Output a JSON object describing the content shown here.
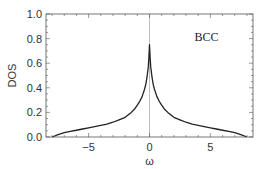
{
  "chart_data": {
    "type": "line",
    "title": "",
    "xlabel": "ω",
    "ylabel": "DOS",
    "xlim": [
      -8.5,
      8.5
    ],
    "ylim": [
      0.0,
      1.0
    ],
    "xticks": [
      -5,
      0,
      5
    ],
    "xtick_labels": [
      "−5",
      "0",
      "5"
    ],
    "yticks": [
      0.0,
      0.2,
      0.4,
      0.6,
      0.8,
      1.0
    ],
    "ytick_labels": [
      "0.0",
      "0.2",
      "0.4",
      "0.6",
      "0.8",
      "1.0"
    ],
    "grid": false,
    "legend": null,
    "annotations": [
      {
        "text": "BCC",
        "x": 3.7,
        "y": 0.78
      }
    ],
    "vertical_line": {
      "x": 0,
      "color": "#aaaaaa"
    },
    "series": [
      {
        "name": "BCC DOS",
        "color": "#222222",
        "x": [
          -8.0,
          -7.5,
          -7.0,
          -6.5,
          -6.0,
          -5.5,
          -5.0,
          -4.5,
          -4.0,
          -3.5,
          -3.0,
          -2.5,
          -2.0,
          -1.5,
          -1.2,
          -1.0,
          -0.8,
          -0.6,
          -0.4,
          -0.3,
          -0.2,
          -0.1,
          -0.05,
          0.0,
          0.05,
          0.1,
          0.2,
          0.3,
          0.4,
          0.6,
          0.8,
          1.0,
          1.2,
          1.5,
          2.0,
          2.5,
          3.0,
          3.5,
          4.0,
          4.5,
          5.0,
          5.5,
          6.0,
          6.5,
          7.0,
          7.5,
          8.0
        ],
        "y": [
          0.0,
          0.02,
          0.035,
          0.045,
          0.055,
          0.065,
          0.075,
          0.085,
          0.095,
          0.105,
          0.12,
          0.14,
          0.16,
          0.2,
          0.23,
          0.26,
          0.29,
          0.33,
          0.39,
          0.43,
          0.49,
          0.57,
          0.65,
          0.75,
          0.65,
          0.57,
          0.49,
          0.43,
          0.39,
          0.33,
          0.29,
          0.26,
          0.23,
          0.2,
          0.16,
          0.14,
          0.12,
          0.105,
          0.095,
          0.085,
          0.075,
          0.065,
          0.055,
          0.045,
          0.035,
          0.02,
          0.0
        ]
      }
    ]
  },
  "plot_area": {
    "left": 46,
    "top": 14,
    "right": 253,
    "bottom": 137
  }
}
